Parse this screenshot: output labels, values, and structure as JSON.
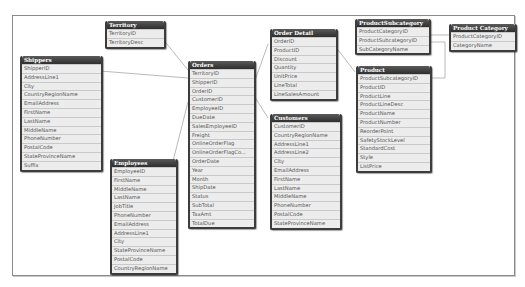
{
  "tables": {
    "territory": {
      "title": "Territory",
      "fields": [
        "TerritoryID",
        "TerritoryDesc"
      ]
    },
    "shippers": {
      "title": "Shippers",
      "fields": [
        "ShipperID",
        "AddressLine1",
        "City",
        "CountryRegionName",
        "EmailAddress",
        "FirstName",
        "LastName",
        "MiddleName",
        "PhoneNumber",
        "PostalCode",
        "StateProvinceName",
        "Suffix"
      ]
    },
    "employees": {
      "title": "Employees",
      "fields": [
        "EmployeeID",
        "FirstName",
        "MiddleName",
        "LastName",
        "JobTitle",
        "PhoneNumber",
        "EmailAddress",
        "AddressLine1",
        "City",
        "StateProvinceName",
        "PostalCode",
        "CountryRegionName"
      ]
    },
    "orders": {
      "title": "Orders",
      "fields": [
        "TerritoryID",
        "ShipperID",
        "OrderID",
        "CustomerID",
        "EmployeeID",
        "DueDate",
        "SalesEmployeeID",
        "Freight",
        "OnlineOrderFlag",
        "OnlineOrderFlagCo...",
        "OrderDate",
        "Year",
        "Month",
        "ShipDate",
        "Status",
        "SubTotal",
        "TaxAmt",
        "TotalDue"
      ]
    },
    "order_detail": {
      "title": "Order Detail",
      "fields": [
        "OrderID",
        "ProductID",
        "Discount",
        "Quantity",
        "UnitPrice",
        "LineTotal",
        "LineSalesAmount"
      ]
    },
    "customers": {
      "title": "Customers",
      "fields": [
        "CustomerID",
        "CountryRegionName",
        "AddressLine1",
        "AddressLine2",
        "City",
        "EmailAddress",
        "FirstName",
        "LastName",
        "MiddleName",
        "PhoneNumber",
        "PostalCode",
        "StateProvinceName"
      ]
    },
    "product_subcategory": {
      "title": "ProductSubcategory",
      "fields": [
        "ProductCategoryID",
        "ProductSubcategoryID",
        "SubCategoryName"
      ]
    },
    "product_category": {
      "title": "Product Category",
      "fields": [
        "ProductCategoryID",
        "CategoryName"
      ]
    },
    "product": {
      "title": "Product",
      "fields": [
        "ProductSubcategoryID",
        "ProductID",
        "ProductLine",
        "ProductLineDesc",
        "ProductName",
        "ProductNumber",
        "ReorderPoint",
        "SafetyStockLevel",
        "StandardCost",
        "Style",
        "ListPrice"
      ]
    }
  },
  "colors": {
    "header": "#3c3c3c",
    "row": "#ebebeb",
    "line": "#b0b0b0"
  }
}
